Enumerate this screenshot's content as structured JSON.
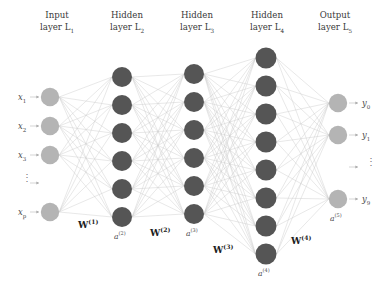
{
  "figure": {
    "type": "neural-network-diagram",
    "background": "#ffffff",
    "width": 387,
    "height": 286
  },
  "colors": {
    "input_node": "#b4b4b4",
    "hidden_node": "#555555",
    "output_node": "#b4b4b4",
    "edge": "#cccccc",
    "text": "#3a3a3a",
    "weight_text": "#1d1d1d"
  },
  "headers": [
    {
      "line1": "Input",
      "line2": "layer L",
      "sub": "1",
      "x": 22,
      "y": 10
    },
    {
      "line1": "Hidden",
      "line2": "layer L",
      "sub": "2",
      "x": 92,
      "y": 10
    },
    {
      "line1": "Hidden",
      "line2": "layer L",
      "sub": "3",
      "x": 162,
      "y": 10
    },
    {
      "line1": "Hidden",
      "line2": "layer L",
      "sub": "4",
      "x": 232,
      "y": 10
    },
    {
      "line1": "Output",
      "line2": "layer L",
      "sub": "5",
      "x": 300,
      "y": 10
    }
  ],
  "layers": [
    {
      "id": "L1",
      "name": "input-layer",
      "cx": 50,
      "radius": 9.2,
      "fill": "#b4b4b4",
      "node_count": 5,
      "cys": [
        97,
        126,
        155,
        183,
        212
      ],
      "ellipsis_index": 3
    },
    {
      "id": "L2",
      "name": "hidden-layer-2",
      "cx": 122,
      "radius": 10,
      "fill": "#555555",
      "node_count": 6,
      "cys": [
        77,
        105,
        133,
        161,
        189,
        217
      ],
      "ellipsis_index": -1
    },
    {
      "id": "L3",
      "name": "hidden-layer-3",
      "cx": 194,
      "radius": 10,
      "fill": "#555555",
      "node_count": 6,
      "cys": [
        74,
        102,
        130,
        158,
        186,
        214
      ],
      "ellipsis_index": -1
    },
    {
      "id": "L4",
      "name": "hidden-layer-4",
      "cx": 266,
      "radius": 10.5,
      "fill": "#555555",
      "node_count": 8,
      "cys": [
        58,
        86,
        114,
        142,
        170,
        198,
        226,
        254
      ],
      "ellipsis_index": -1
    },
    {
      "id": "L5",
      "name": "output-layer",
      "cx": 338,
      "radius": 9.2,
      "fill": "#b4b4b4",
      "node_count": 4,
      "cys": [
        103,
        135,
        167,
        199
      ],
      "ellipsis_index": 2
    }
  ],
  "input_labels": [
    {
      "text": "x",
      "sub": "1",
      "x": 18,
      "y": 92,
      "arrow_y": 97
    },
    {
      "text": "x",
      "sub": "2",
      "x": 18,
      "y": 121,
      "arrow_y": 126
    },
    {
      "text": "x",
      "sub": "3",
      "x": 18,
      "y": 150,
      "arrow_y": 155
    },
    {
      "text": "⋮",
      "sub": "",
      "x": 22,
      "y": 176,
      "arrow_y": 183
    },
    {
      "text": "x",
      "sub": "p",
      "x": 18,
      "y": 207,
      "arrow_y": 212
    }
  ],
  "output_labels": [
    {
      "text": "y",
      "sub": "0",
      "x": 362,
      "y": 98,
      "arrow_y": 103
    },
    {
      "text": "y",
      "sub": "1",
      "x": 362,
      "y": 130,
      "arrow_y": 135
    },
    {
      "text": "⋮",
      "sub": "",
      "x": 366,
      "y": 160,
      "arrow_y": 167
    },
    {
      "text": "y",
      "sub": "9",
      "x": 362,
      "y": 194,
      "arrow_y": 199
    }
  ],
  "weight_labels": [
    {
      "text": "W",
      "sup": "(1)",
      "x": 78,
      "y": 218
    },
    {
      "text": "W",
      "sup": "(2)",
      "x": 150,
      "y": 226
    },
    {
      "text": "W",
      "sup": "(3)",
      "x": 213,
      "y": 243
    },
    {
      "text": "W",
      "sup": "(4)",
      "x": 291,
      "y": 234
    }
  ],
  "activation_labels": [
    {
      "text": "a",
      "sup": "(2)",
      "x": 114,
      "y": 230
    },
    {
      "text": "a",
      "sup": "(3)",
      "x": 186,
      "y": 227
    },
    {
      "text": "a",
      "sup": "(4)",
      "x": 258,
      "y": 267
    },
    {
      "text": "a",
      "sup": "(5)",
      "x": 330,
      "y": 212
    }
  ]
}
